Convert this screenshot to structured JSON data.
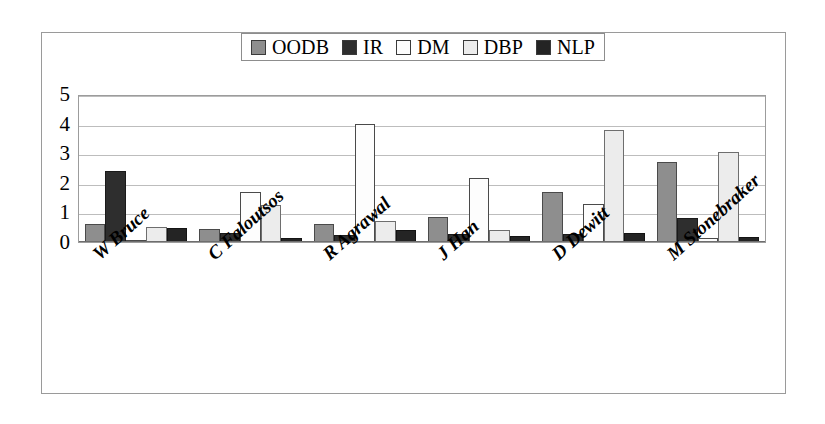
{
  "chart_data": {
    "type": "bar",
    "title": "",
    "subtitle": "",
    "xlabel": "",
    "ylabel": "",
    "ylim": [
      0,
      5
    ],
    "yticks": [
      "0",
      "1",
      "2",
      "3",
      "4",
      "5"
    ],
    "grid": true,
    "legend_position": "top-center",
    "categories": [
      "W Bruce",
      "C Faloutsos",
      "R Agrawal",
      "J Han",
      "D Dewitt",
      "M Stonebraker"
    ],
    "series": [
      {
        "name": "OODB",
        "color": "#8e8e8e",
        "values": [
          0.6,
          0.45,
          0.62,
          0.85,
          1.7,
          2.7
        ]
      },
      {
        "name": "IR",
        "color": "#2e2e2e",
        "values": [
          2.4,
          0.3,
          0.25,
          0.28,
          0.28,
          0.8
        ]
      },
      {
        "name": "DM",
        "color": "#fdfdfd",
        "values": [
          0.07,
          1.7,
          4.0,
          2.15,
          1.3,
          0.15
        ]
      },
      {
        "name": "DBP",
        "color": "#ececec",
        "values": [
          0.52,
          1.25,
          0.7,
          0.4,
          3.8,
          3.05
        ]
      },
      {
        "name": "NLP",
        "color": "#242424",
        "values": [
          0.48,
          0.12,
          0.4,
          0.22,
          0.3,
          0.18
        ]
      }
    ]
  },
  "legend": {
    "items": [
      {
        "label": "OODB",
        "color": "#8e8e8e"
      },
      {
        "label": "IR",
        "color": "#2e2e2e"
      },
      {
        "label": "DM",
        "color": "#fdfdfd"
      },
      {
        "label": "DBP",
        "color": "#ececec"
      },
      {
        "label": "NLP",
        "color": "#242424"
      }
    ]
  }
}
